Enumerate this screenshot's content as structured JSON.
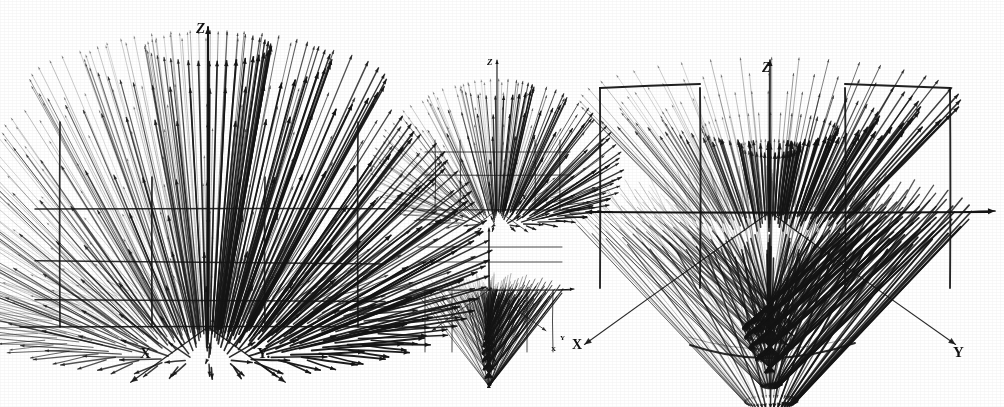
{
  "figure": {
    "background_color": "#ffffff",
    "ink_color": "#141414",
    "width": 1004,
    "height": 407
  },
  "panels": [
    {
      "id": "panel-left",
      "name": "left-quiver-plot",
      "description": "Large dome-shaped 3D radial vector field with arrows emanating upward and outward from origin",
      "origin": {
        "x": 208,
        "y": 327
      },
      "axes": [
        {
          "name": "z-axis",
          "label": "Z",
          "direction": "up"
        },
        {
          "name": "x-axis",
          "label": "X",
          "direction": "down-left"
        },
        {
          "name": "y-axis",
          "label": "Y.",
          "direction": "down-right"
        }
      ],
      "shape": "dome",
      "arrow_count": 420
    },
    {
      "id": "panel-mid-top",
      "name": "mid-top-quiver-plot",
      "description": "Small upper middle 3D vector field, narrow fan shape",
      "origin": {
        "x": 497,
        "y": 210
      },
      "axes": [
        {
          "name": "z-axis",
          "label": "Z",
          "direction": "up"
        },
        {
          "name": "x-axis",
          "label": "X",
          "direction": "down-left"
        },
        {
          "name": "y-axis",
          "label": "Y",
          "direction": "down-right"
        }
      ],
      "shape": "fan",
      "arrow_count": 150
    },
    {
      "id": "panel-mid-bottom",
      "name": "mid-bottom-quiver-plot",
      "description": "Small lower middle 3D vector field, converging saddle shape",
      "origin": {
        "x": 489,
        "y": 290
      },
      "axes": [
        {
          "name": "z-axis",
          "label": "Z",
          "direction": "up"
        },
        {
          "name": "x-axis",
          "label": "X",
          "direction": "down-left"
        },
        {
          "name": "y-axis",
          "label": "Y",
          "direction": "down-right"
        }
      ],
      "shape": "saddle",
      "arrow_count": 150
    },
    {
      "id": "panel-right",
      "name": "right-quiver-plot",
      "description": "Large butterfly/saddle 3D vector field with arrows converging at a central notch",
      "origin": {
        "x": 770,
        "y": 212
      },
      "axes": [
        {
          "name": "z-axis",
          "label": "Z",
          "direction": "up"
        },
        {
          "name": "x-axis",
          "label": "X",
          "direction": "down-left"
        },
        {
          "name": "y-axis",
          "label": "Y",
          "direction": "down-right"
        }
      ],
      "shape": "butterfly",
      "arrow_count": 420
    }
  ],
  "labels": {
    "left_z": "Z",
    "left_x": "X",
    "left_y": "Y.",
    "mid_top_z": "Z",
    "mid_top_x": "X",
    "mid_top_y": "Y",
    "mid_bottom_z": "Z",
    "mid_bottom_x": "X",
    "mid_bottom_y": "Y",
    "right_z": "Z",
    "right_x": "X",
    "right_y": "Y"
  },
  "chart_data": {
    "type": "scatter",
    "xlabel": "X",
    "ylabel": "Y",
    "zlabel": "Z",
    "grid": false,
    "legend": "none",
    "series": [
      {
        "name": "left-dome-field",
        "note": "Radial arrows of increasing length forming a dome; dense vertical core",
        "arrow_count": 420,
        "max_radius_px": 175
      },
      {
        "name": "mid-top-fan-field",
        "note": "Small fan of arrows directed upward and outward",
        "arrow_count": 150,
        "max_radius_px": 75
      },
      {
        "name": "mid-bottom-saddle-field",
        "note": "Small field with arrows converging toward the z axis then flaring down",
        "arrow_count": 150,
        "max_radius_px": 75
      },
      {
        "name": "right-butterfly-field",
        "note": "Large field with a V-shaped notch at top; arrows converge at center",
        "arrow_count": 420,
        "max_radius_px": 200
      }
    ]
  }
}
